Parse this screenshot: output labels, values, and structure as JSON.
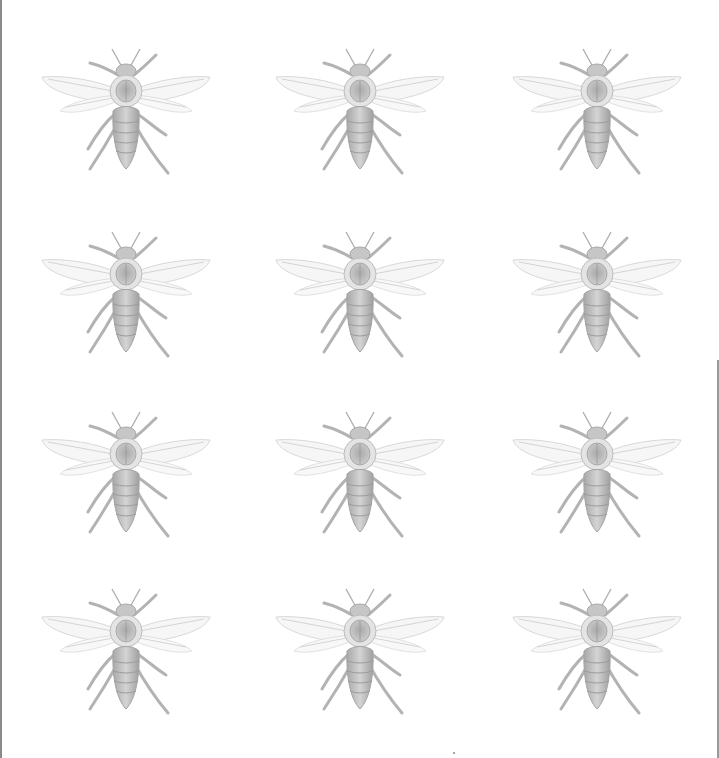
{
  "page": {
    "background": "#ffffff",
    "pattern": "honeybee engraving repeat",
    "grid": {
      "columns": 3,
      "rows": 4
    },
    "ink_color": "#b8b8b8"
  },
  "bees": [
    {
      "row": 0,
      "col": 0,
      "x": 38,
      "y": 45
    },
    {
      "row": 0,
      "col": 1,
      "x": 272,
      "y": 45
    },
    {
      "row": 0,
      "col": 2,
      "x": 509,
      "y": 45
    },
    {
      "row": 1,
      "col": 0,
      "x": 38,
      "y": 228
    },
    {
      "row": 1,
      "col": 1,
      "x": 272,
      "y": 228
    },
    {
      "row": 1,
      "col": 2,
      "x": 509,
      "y": 228
    },
    {
      "row": 2,
      "col": 0,
      "x": 38,
      "y": 408
    },
    {
      "row": 2,
      "col": 1,
      "x": 272,
      "y": 408
    },
    {
      "row": 2,
      "col": 2,
      "x": 509,
      "y": 408
    },
    {
      "row": 3,
      "col": 0,
      "x": 38,
      "y": 585
    },
    {
      "row": 3,
      "col": 1,
      "x": 272,
      "y": 585
    },
    {
      "row": 3,
      "col": 2,
      "x": 509,
      "y": 585
    }
  ]
}
